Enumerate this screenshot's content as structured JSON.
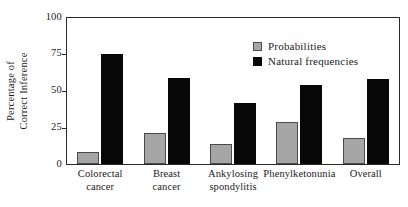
{
  "chart_data": {
    "type": "bar",
    "title": "",
    "xlabel": "",
    "ylabel": "Percentage of Correct Inference",
    "ylabel_lines": [
      "Percentage of",
      "Correct Inference"
    ],
    "ylim": [
      0,
      100
    ],
    "yticks": [
      0,
      25,
      50,
      75,
      100
    ],
    "ytick_labels": [
      "0",
      "25",
      "50",
      "75",
      "100"
    ],
    "grid": false,
    "legend_position": "top-right",
    "categories": [
      "Colorectal cancer",
      "Breast cancer",
      "Ankylosing spondylitis",
      "Phenylketonunia",
      "Overall"
    ],
    "category_lines": [
      [
        "Colorectal",
        "cancer"
      ],
      [
        "Breast",
        "cancer"
      ],
      [
        "Ankylosing",
        "spondylitis"
      ],
      [
        "Phenylketonunia",
        ""
      ],
      [
        "Overall",
        ""
      ]
    ],
    "series": [
      {
        "name": "Probabilities",
        "color": "#a6a6a6",
        "values": [
          8,
          21,
          14,
          29,
          18
        ]
      },
      {
        "name": "Natural frequencies",
        "color": "#070707",
        "values": [
          75,
          59,
          42,
          54,
          58
        ]
      }
    ]
  },
  "legend": {
    "items": [
      {
        "label": "Probabilities",
        "swatch": "probabilities-swatch"
      },
      {
        "label": "Natural frequencies",
        "swatch": "natural-frequencies-swatch"
      }
    ]
  },
  "axis": {
    "y_title_line1": "Percentage of",
    "y_title_line2": "Correct Inference",
    "y_tick_100": "100",
    "y_tick_75": "75",
    "y_tick_50": "50",
    "y_tick_25": "25",
    "y_tick_0": "0"
  },
  "xlabels": [
    {
      "line1": "Colorectal",
      "line2": "cancer"
    },
    {
      "line1": "Breast",
      "line2": "cancer"
    },
    {
      "line1": "Ankylosing",
      "line2": "spondylitis"
    },
    {
      "line1": "Phenylketonunia",
      "line2": ""
    },
    {
      "line1": "Overall",
      "line2": ""
    }
  ]
}
